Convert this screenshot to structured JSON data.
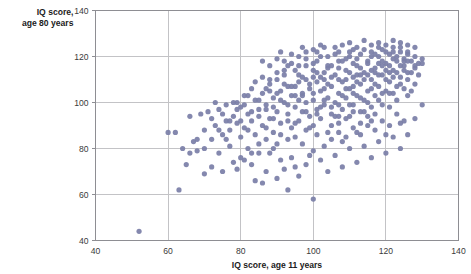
{
  "chart_data": {
    "type": "scatter",
    "title": "",
    "xlabel": "IQ score, age 11 years",
    "ylabel": "IQ score,\nage 80 years",
    "ylabel_line1": "IQ score,",
    "ylabel_line2": "age 80 years",
    "xlim": [
      40,
      140
    ],
    "ylim": [
      40,
      140
    ],
    "xticks": [
      40,
      60,
      80,
      100,
      120,
      140
    ],
    "yticks": [
      40,
      60,
      80,
      100,
      120,
      140
    ],
    "xtick_labels": [
      "40",
      "60",
      "80",
      "100",
      "120",
      "140"
    ],
    "ytick_labels": [
      "40",
      "60",
      "80",
      "100",
      "120",
      "140"
    ],
    "grid": true,
    "legend": "none",
    "marker_color": "#7b7fa8",
    "grid_color": "#c3c3c6",
    "frame_color": "#8e8e93",
    "background": "#ffffff",
    "marker_size": 5.2,
    "n_points": 372,
    "points": [
      [
        52,
        44
      ],
      [
        60,
        87
      ],
      [
        62,
        87
      ],
      [
        63,
        62
      ],
      [
        64,
        80
      ],
      [
        65,
        73
      ],
      [
        66,
        94
      ],
      [
        67,
        83
      ],
      [
        68,
        79
      ],
      [
        69,
        95
      ],
      [
        70,
        69
      ],
      [
        70,
        88
      ],
      [
        71,
        96
      ],
      [
        72,
        84
      ],
      [
        72,
        72
      ],
      [
        73,
        90
      ],
      [
        74,
        97
      ],
      [
        74,
        78
      ],
      [
        75,
        86
      ],
      [
        75,
        70
      ],
      [
        76,
        92
      ],
      [
        76,
        99
      ],
      [
        77,
        81
      ],
      [
        77,
        88
      ],
      [
        78,
        94
      ],
      [
        78,
        74
      ],
      [
        79,
        91
      ],
      [
        79,
        100
      ],
      [
        80,
        85
      ],
      [
        80,
        76
      ],
      [
        80,
        98
      ],
      [
        81,
        103
      ],
      [
        81,
        89
      ],
      [
        82,
        95
      ],
      [
        82,
        80
      ],
      [
        83,
        106
      ],
      [
        83,
        92
      ],
      [
        84,
        86
      ],
      [
        84,
        101
      ],
      [
        85,
        97
      ],
      [
        85,
        78
      ],
      [
        86,
        104
      ],
      [
        86,
        90
      ],
      [
        87,
        99
      ],
      [
        87,
        84
      ],
      [
        88,
        108
      ],
      [
        88,
        93
      ],
      [
        89,
        102
      ],
      [
        89,
        87
      ],
      [
        90,
        110
      ],
      [
        90,
        96
      ],
      [
        90,
        82
      ],
      [
        91,
        105
      ],
      [
        91,
        91
      ],
      [
        92,
        100
      ],
      [
        92,
        112
      ],
      [
        93,
        62
      ],
      [
        93,
        95
      ],
      [
        93,
        107
      ],
      [
        94,
        89
      ],
      [
        94,
        103
      ],
      [
        95,
        98
      ],
      [
        95,
        114
      ],
      [
        95,
        85
      ],
      [
        96,
        92
      ],
      [
        96,
        109
      ],
      [
        97,
        104
      ],
      [
        97,
        96
      ],
      [
        98,
        100
      ],
      [
        98,
        116
      ],
      [
        98,
        88
      ],
      [
        99,
        106
      ],
      [
        99,
        94
      ],
      [
        100,
        58
      ],
      [
        100,
        111
      ],
      [
        100,
        101
      ],
      [
        100,
        90
      ],
      [
        101,
        97
      ],
      [
        101,
        118
      ],
      [
        102,
        105
      ],
      [
        102,
        93
      ],
      [
        103,
        110
      ],
      [
        103,
        99
      ],
      [
        104,
        115
      ],
      [
        104,
        102
      ],
      [
        104,
        87
      ],
      [
        105,
        107
      ],
      [
        105,
        95
      ],
      [
        106,
        112
      ],
      [
        106,
        100
      ],
      [
        107,
        118
      ],
      [
        107,
        104
      ],
      [
        107,
        91
      ],
      [
        108,
        109
      ],
      [
        108,
        97
      ],
      [
        109,
        114
      ],
      [
        109,
        102
      ],
      [
        110,
        120
      ],
      [
        110,
        106
      ],
      [
        110,
        94
      ],
      [
        111,
        111
      ],
      [
        111,
        99
      ],
      [
        112,
        116
      ],
      [
        112,
        103
      ],
      [
        113,
        121
      ],
      [
        113,
        108
      ],
      [
        113,
        96
      ],
      [
        114,
        113
      ],
      [
        114,
        101
      ],
      [
        115,
        118
      ],
      [
        115,
        105
      ],
      [
        116,
        122
      ],
      [
        116,
        110
      ],
      [
        116,
        98
      ],
      [
        117,
        115
      ],
      [
        117,
        103
      ],
      [
        118,
        120
      ],
      [
        118,
        107
      ],
      [
        119,
        123
      ],
      [
        119,
        112
      ],
      [
        120,
        117
      ],
      [
        120,
        105
      ],
      [
        121,
        121
      ],
      [
        121,
        109
      ],
      [
        122,
        124
      ],
      [
        122,
        114
      ],
      [
        123,
        118
      ],
      [
        123,
        107
      ],
      [
        124,
        122
      ],
      [
        124,
        111
      ],
      [
        125,
        119
      ],
      [
        125,
        116
      ],
      [
        126,
        121
      ],
      [
        126,
        113
      ],
      [
        127,
        118
      ],
      [
        128,
        120
      ],
      [
        128,
        115
      ],
      [
        129,
        117
      ],
      [
        130,
        119
      ],
      [
        84,
        66
      ],
      [
        86,
        65
      ],
      [
        88,
        78
      ],
      [
        90,
        67
      ],
      [
        92,
        71
      ],
      [
        94,
        76
      ],
      [
        96,
        68
      ],
      [
        98,
        73
      ],
      [
        100,
        79
      ],
      [
        102,
        75
      ],
      [
        104,
        70
      ],
      [
        106,
        77
      ],
      [
        108,
        72
      ],
      [
        110,
        80
      ],
      [
        112,
        74
      ],
      [
        114,
        81
      ],
      [
        116,
        76
      ],
      [
        118,
        83
      ],
      [
        120,
        78
      ],
      [
        122,
        85
      ],
      [
        124,
        80
      ],
      [
        126,
        86
      ],
      [
        128,
        93
      ],
      [
        130,
        99
      ],
      [
        82,
        103
      ],
      [
        84,
        109
      ],
      [
        86,
        111
      ],
      [
        88,
        105
      ],
      [
        90,
        113
      ],
      [
        92,
        108
      ],
      [
        94,
        117
      ],
      [
        96,
        112
      ],
      [
        98,
        119
      ],
      [
        100,
        114
      ],
      [
        102,
        120
      ],
      [
        104,
        116
      ],
      [
        106,
        121
      ],
      [
        108,
        118
      ],
      [
        110,
        122
      ],
      [
        112,
        119
      ],
      [
        114,
        123
      ],
      [
        116,
        120
      ],
      [
        118,
        124
      ],
      [
        120,
        122
      ],
      [
        122,
        119
      ],
      [
        124,
        124
      ],
      [
        126,
        122
      ],
      [
        95,
        107
      ],
      [
        97,
        111
      ],
      [
        99,
        108
      ],
      [
        101,
        113
      ],
      [
        103,
        106
      ],
      [
        105,
        116
      ],
      [
        107,
        110
      ],
      [
        109,
        119
      ],
      [
        111,
        107
      ],
      [
        113,
        115
      ],
      [
        115,
        112
      ],
      [
        117,
        121
      ],
      [
        119,
        116
      ],
      [
        121,
        113
      ],
      [
        123,
        120
      ],
      [
        125,
        114
      ],
      [
        96,
        101
      ],
      [
        98,
        96
      ],
      [
        100,
        104
      ],
      [
        102,
        98
      ],
      [
        104,
        108
      ],
      [
        106,
        94
      ],
      [
        108,
        103
      ],
      [
        110,
        99
      ],
      [
        112,
        109
      ],
      [
        114,
        96
      ],
      [
        116,
        106
      ],
      [
        118,
        101
      ],
      [
        120,
        110
      ],
      [
        122,
        104
      ],
      [
        124,
        108
      ],
      [
        126,
        103
      ],
      [
        87,
        97
      ],
      [
        89,
        93
      ],
      [
        91,
        101
      ],
      [
        93,
        99
      ],
      [
        95,
        91
      ],
      [
        97,
        103
      ],
      [
        99,
        89
      ],
      [
        101,
        95
      ],
      [
        103,
        101
      ],
      [
        105,
        90
      ],
      [
        107,
        99
      ],
      [
        109,
        93
      ],
      [
        111,
        104
      ],
      [
        113,
        91
      ],
      [
        115,
        100
      ],
      [
        117,
        95
      ],
      [
        119,
        104
      ],
      [
        121,
        98
      ],
      [
        79,
        71
      ],
      [
        81,
        75
      ],
      [
        83,
        73
      ],
      [
        85,
        82
      ],
      [
        87,
        70
      ],
      [
        89,
        80
      ],
      [
        91,
        75
      ],
      [
        93,
        84
      ],
      [
        95,
        72
      ],
      [
        97,
        82
      ],
      [
        99,
        77
      ],
      [
        101,
        86
      ],
      [
        103,
        81
      ],
      [
        105,
        84
      ],
      [
        107,
        87
      ],
      [
        109,
        85
      ],
      [
        111,
        89
      ],
      [
        113,
        86
      ],
      [
        115,
        90
      ],
      [
        117,
        88
      ],
      [
        119,
        92
      ],
      [
        121,
        90
      ],
      [
        123,
        95
      ],
      [
        125,
        92
      ],
      [
        104,
        120
      ],
      [
        106,
        124
      ],
      [
        108,
        125
      ],
      [
        110,
        126
      ],
      [
        112,
        124
      ],
      [
        114,
        127
      ],
      [
        116,
        125
      ],
      [
        118,
        126
      ],
      [
        120,
        125
      ],
      [
        122,
        127
      ],
      [
        124,
        126
      ],
      [
        126,
        125
      ],
      [
        128,
        124
      ],
      [
        100,
        123
      ],
      [
        102,
        125
      ],
      [
        98,
        122
      ],
      [
        96,
        120
      ],
      [
        94,
        121
      ],
      [
        92,
        118
      ],
      [
        90,
        119
      ],
      [
        88,
        116
      ],
      [
        105,
        98
      ],
      [
        107,
        94
      ],
      [
        109,
        106
      ],
      [
        111,
        96
      ],
      [
        113,
        102
      ],
      [
        115,
        94
      ],
      [
        117,
        108
      ],
      [
        119,
        99
      ],
      [
        121,
        104
      ],
      [
        123,
        101
      ],
      [
        125,
        106
      ],
      [
        127,
        113
      ],
      [
        127,
        105
      ],
      [
        66,
        78
      ],
      [
        68,
        84
      ],
      [
        70,
        80
      ],
      [
        72,
        93
      ],
      [
        74,
        88
      ],
      [
        76,
        84
      ],
      [
        78,
        100
      ],
      [
        80,
        92
      ],
      [
        82,
        88
      ],
      [
        83,
        78
      ],
      [
        85,
        94
      ],
      [
        87,
        89
      ],
      [
        89,
        98
      ],
      [
        91,
        86
      ],
      [
        93,
        92
      ],
      [
        95,
        103
      ],
      [
        110,
        113
      ],
      [
        112,
        112
      ],
      [
        114,
        110
      ],
      [
        116,
        114
      ],
      [
        118,
        112
      ],
      [
        120,
        114
      ],
      [
        122,
        111
      ],
      [
        124,
        116
      ],
      [
        126,
        118
      ],
      [
        128,
        116
      ],
      [
        129,
        112
      ],
      [
        101,
        109
      ],
      [
        103,
        113
      ],
      [
        105,
        111
      ],
      [
        107,
        115
      ],
      [
        109,
        110
      ],
      [
        111,
        117
      ],
      [
        113,
        112
      ],
      [
        115,
        117
      ],
      [
        117,
        113
      ],
      [
        119,
        118
      ],
      [
        121,
        116
      ],
      [
        123,
        113
      ],
      [
        125,
        118
      ],
      [
        86,
        118
      ],
      [
        88,
        110
      ],
      [
        90,
        104
      ],
      [
        92,
        114
      ],
      [
        94,
        107
      ],
      [
        96,
        116
      ],
      [
        98,
        110
      ],
      [
        100,
        117
      ],
      [
        102,
        111
      ],
      [
        73,
        100
      ],
      [
        75,
        95
      ],
      [
        77,
        92
      ],
      [
        79,
        97
      ],
      [
        81,
        99
      ],
      [
        83,
        96
      ],
      [
        85,
        101
      ],
      [
        87,
        106
      ],
      [
        108,
        83
      ],
      [
        112,
        87
      ],
      [
        116,
        92
      ],
      [
        120,
        86
      ],
      [
        124,
        91
      ],
      [
        128,
        108
      ],
      [
        91,
        122
      ],
      [
        93,
        116
      ],
      [
        97,
        124
      ],
      [
        101,
        122
      ],
      [
        103,
        124
      ],
      [
        107,
        122
      ],
      [
        111,
        123
      ],
      [
        118,
        117
      ],
      [
        122,
        122
      ],
      [
        126,
        110
      ],
      [
        130,
        117
      ]
    ]
  }
}
